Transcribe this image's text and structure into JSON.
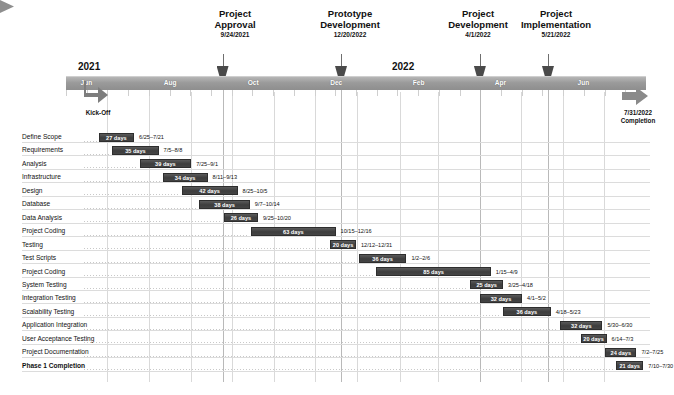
{
  "chart_data": {
    "type": "bar",
    "subtype": "gantt",
    "xlabel": "",
    "ylabel": "",
    "axis": {
      "years": [
        {
          "label": "2021",
          "x": 78
        },
        {
          "label": "2022",
          "x": 392
        }
      ],
      "months": [
        "Jun",
        "Aug",
        "Oct",
        "Dec",
        "Feb",
        "Apr",
        "Jun"
      ],
      "start_label": "Jun",
      "end_label": "Jun",
      "kickoff_label": "Kick-Off",
      "completion_date": "7/31/2022",
      "completion_label": "Completion"
    },
    "milestones": [
      {
        "title": "Project Approval",
        "title_line1": "Project",
        "title_line2": "Approval",
        "date": "9/24/2021"
      },
      {
        "title": "Prototype Development",
        "title_line1": "Prototype",
        "title_line2": "Development",
        "date": "12/20/2022"
      },
      {
        "title": "Project Development",
        "title_line1": "Project",
        "title_line2": "Development",
        "date": "4/1/2022"
      },
      {
        "title": "Project Implementation",
        "title_line1": "Project",
        "title_line2": "Implementation",
        "date": "5/21/2022"
      }
    ],
    "categories": [
      "Define Scope",
      "Requirements",
      "Analysis",
      "Infrastructure",
      "Design",
      "Database",
      "Data Analysis",
      "Project Coding",
      "Testing",
      "Test Scripts",
      "Project Coding",
      "System Testing",
      "Integration Testing",
      "Scalability Testing",
      "Application Integration",
      "User Acceptance Testing",
      "Project Documentation",
      "Phase 1 Completion"
    ],
    "values": [
      27,
      35,
      39,
      34,
      42,
      38,
      26,
      63,
      20,
      36,
      85,
      25,
      32,
      36,
      32,
      20,
      24,
      21
    ],
    "tasks": [
      {
        "name": "Define Scope",
        "duration": "27 days",
        "dates": "6/25–7/21",
        "bold": false
      },
      {
        "name": "Requirements",
        "duration": "35 days",
        "dates": "7/5–8/8",
        "bold": false
      },
      {
        "name": "Analysis",
        "duration": "39 days",
        "dates": "7/25–9/1",
        "bold": false
      },
      {
        "name": "Infrastructure",
        "duration": "34 days",
        "dates": "8/11–9/13",
        "bold": false
      },
      {
        "name": "Design",
        "duration": "42 days",
        "dates": "8/25–10/5",
        "bold": false
      },
      {
        "name": "Database",
        "duration": "38 days",
        "dates": "9/7–10/14",
        "bold": false
      },
      {
        "name": "Data Analysis",
        "duration": "26 days",
        "dates": "9/25–10/20",
        "bold": false
      },
      {
        "name": "Project Coding",
        "duration": "63 days",
        "dates": "10/15–12/16",
        "bold": false
      },
      {
        "name": "Testing",
        "duration": "20 days",
        "dates": "12/12–12/31",
        "bold": false
      },
      {
        "name": "Test Scripts",
        "duration": "36 days",
        "dates": "1/2–2/6",
        "bold": false
      },
      {
        "name": "Project Coding",
        "duration": "85 days",
        "dates": "1/15–4/9",
        "bold": false
      },
      {
        "name": "System Testing",
        "duration": "25 days",
        "dates": "3/25–4/18",
        "bold": false
      },
      {
        "name": "Integration Testing",
        "duration": "32 days",
        "dates": "4/1–5/2",
        "bold": false
      },
      {
        "name": "Scalability Testing",
        "duration": "36 days",
        "dates": "4/18–5/23",
        "bold": false
      },
      {
        "name": "Application Integration",
        "duration": "32 days",
        "dates": "5/30–6/30",
        "bold": false
      },
      {
        "name": "User Acceptance Testing",
        "duration": "20 days",
        "dates": "6/14–7/3",
        "bold": false
      },
      {
        "name": "Project Documentation",
        "duration": "24 days",
        "dates": "7/2–7/25",
        "bold": false
      },
      {
        "name": "Phase 1 Completion",
        "duration": "21 days",
        "dates": "7/10–7/30",
        "bold": true
      }
    ],
    "colors": {
      "bar": "#3d3d3d",
      "bar_text": "#ffffff",
      "ribbon": "#9a9a9a",
      "grid": "#d9d9d9",
      "text": "#111111"
    },
    "grid": true,
    "legend": "none"
  }
}
